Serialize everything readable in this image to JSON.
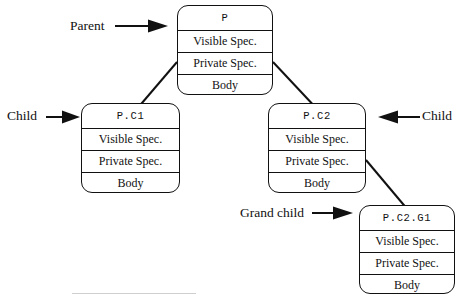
{
  "diagram": {
    "background_color": "#ffffff",
    "line_color": "#111111",
    "row_labels": {
      "visible_spec": "Visible Spec.",
      "private_spec": "Private Spec.",
      "body": "Body"
    },
    "nodes": [
      {
        "id": "parent",
        "name": "P",
        "rows": [
          "P",
          "Visible Spec.",
          "Private Spec.",
          "Body"
        ]
      },
      {
        "id": "child1",
        "name": "P.C1",
        "rows": [
          "P.C1",
          "Visible Spec.",
          "Private Spec.",
          "Body"
        ]
      },
      {
        "id": "child2",
        "name": "P.C2",
        "rows": [
          "P.C2",
          "Visible Spec.",
          "Private Spec.",
          "Body"
        ]
      },
      {
        "id": "grandchild",
        "name": "P.C2.G1",
        "rows": [
          "P.C2.G1",
          "Visible Spec.",
          "Private Spec.",
          "Body"
        ]
      }
    ],
    "annotations": [
      {
        "id": "parent-annot",
        "label": "Parent",
        "arrow": "right"
      },
      {
        "id": "child-left-annot",
        "label": "Child",
        "arrow": "right"
      },
      {
        "id": "child-right-annot",
        "label": "Child",
        "arrow": "left"
      },
      {
        "id": "grand-annot",
        "label": "Grand child",
        "arrow": "right"
      }
    ],
    "connectors": [
      {
        "from": "parent",
        "to": "child1"
      },
      {
        "from": "parent",
        "to": "child2"
      },
      {
        "from": "child2",
        "to": "grandchild"
      }
    ]
  }
}
